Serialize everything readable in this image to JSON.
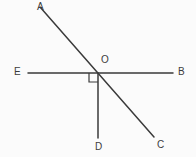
{
  "figure": {
    "background_color": "#fbfbfb",
    "stroke_color": "#3a3a3a",
    "label_color": "#3c3c3c",
    "stroke_width": 1.5,
    "width": 196,
    "height": 157
  },
  "points": {
    "A": {
      "label": "A",
      "x": 40,
      "y": 7,
      "label_x": 37,
      "label_y": 2
    },
    "B": {
      "label": "B",
      "x": 173,
      "y": 73,
      "label_x": 178,
      "label_y": 67
    },
    "C": {
      "label": "C",
      "x": 154,
      "y": 137,
      "label_x": 157,
      "label_y": 140
    },
    "D": {
      "label": "D",
      "x": 98,
      "y": 138,
      "label_x": 95,
      "label_y": 142
    },
    "E": {
      "label": "E",
      "x": 28,
      "y": 73,
      "label_x": 14,
      "label_y": 67
    },
    "O": {
      "label": "O",
      "x": 98,
      "y": 73,
      "label_x": 101,
      "label_y": 55
    }
  },
  "segments": [
    {
      "name": "line-AC",
      "from": "A",
      "to": "C",
      "x1": 40,
      "y1": 7,
      "x2": 154,
      "y2": 137
    },
    {
      "name": "line-EB",
      "from": "E",
      "to": "B",
      "x1": 28,
      "y1": 73,
      "x2": 173,
      "y2": 73
    },
    {
      "name": "ray-OD",
      "from": "O",
      "to": "D",
      "x1": 98,
      "y1": 73,
      "x2": 98,
      "y2": 138
    }
  ],
  "right_angle_marker": {
    "name": "right-angle-DOE",
    "vertex": "O",
    "size": 9,
    "x": 89,
    "y": 73,
    "path": "M 89 73 L 89 82 L 98 82"
  }
}
